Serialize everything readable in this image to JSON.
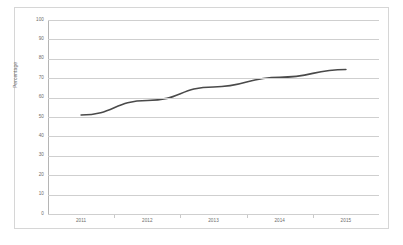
{
  "figure": {
    "background_color": "#ffffff",
    "frame_border_color": "#d6d6d6"
  },
  "chart_data": {
    "type": "line",
    "title": "",
    "subtitle": "",
    "xlabel": "",
    "ylabel": "Percentage",
    "x": [
      "2011",
      "2012",
      "2013",
      "2014",
      "2015"
    ],
    "categories": [
      "2011",
      "2012",
      "2013",
      "2014",
      "2015"
    ],
    "values": [
      51,
      58.5,
      65.5,
      70.5,
      74.5
    ],
    "series": [
      {
        "name": "Percentage",
        "values": [
          51,
          58.5,
          65.5,
          70.5,
          74.5
        ],
        "color": "#4a4a4a",
        "line_width": 1.6,
        "markers": false
      }
    ],
    "ylim": [
      0,
      100
    ],
    "y_ticks": [
      0,
      10,
      20,
      30,
      40,
      50,
      60,
      70,
      80,
      90,
      100
    ],
    "y_tick_labels": [
      "0",
      "10",
      "20",
      "30",
      "40",
      "50",
      "60",
      "70",
      "80",
      "90",
      "100"
    ],
    "x_tick_labels": [
      "2011",
      "2012",
      "2013",
      "2014",
      "2015"
    ],
    "grid": {
      "horizontal": true,
      "vertical": false,
      "color": "#cfcfcf"
    },
    "legend": {
      "visible": false,
      "position": "none"
    },
    "annotations": []
  },
  "axis": {
    "y_title": "Percentage",
    "y_axis_line_color": "#b5b5b5",
    "tick_label_color": "#6b6b6b"
  }
}
